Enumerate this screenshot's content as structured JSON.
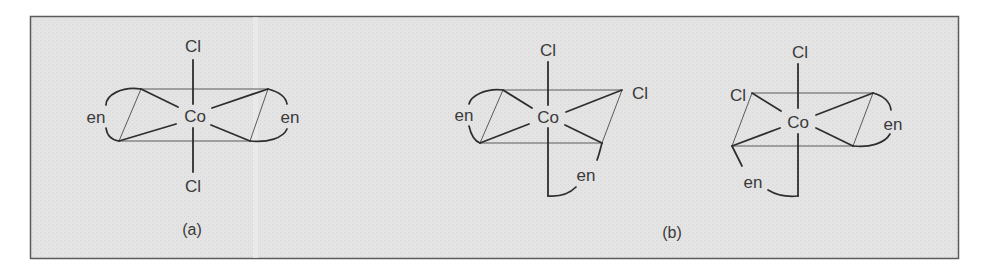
{
  "figure": {
    "panel": {
      "background": "#e4e4e4",
      "border": "#5a5a5a"
    },
    "structure_a": {
      "caption": "(a)",
      "center": "Co",
      "ligand_top": "Cl",
      "ligand_bottom": "Cl",
      "ligand_left": "en",
      "ligand_right": "en"
    },
    "structure_b1": {
      "center": "Co",
      "ligand_top": "Cl",
      "ligand_right": "Cl",
      "ligand_left": "en",
      "ligand_bottom": "en"
    },
    "structure_b2": {
      "center": "Co",
      "ligand_top": "Cl",
      "ligand_left": "Cl",
      "ligand_right": "en",
      "ligand_bottom": "en"
    },
    "caption_b": "(b)"
  }
}
